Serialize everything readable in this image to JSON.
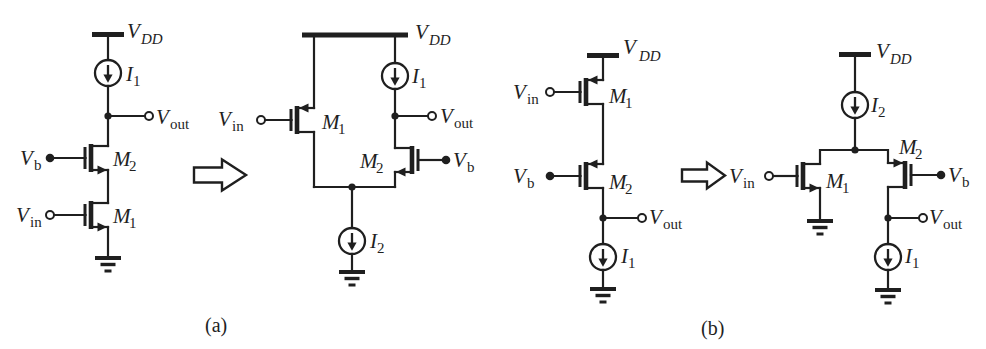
{
  "colors": {
    "ink": "#1f1f1f",
    "background": "#ffffff"
  },
  "labels": {
    "vdd": {
      "base": "V",
      "sub": "DD"
    },
    "vin": {
      "base": "V",
      "sub": "in"
    },
    "vout": {
      "base": "V",
      "sub": "out"
    },
    "vb": {
      "base": "V",
      "sub": "b"
    },
    "i1": {
      "base": "I",
      "sub": "1"
    },
    "i2": {
      "base": "I",
      "sub": "2"
    },
    "m1": {
      "base": "M",
      "sub": "1"
    },
    "m2": {
      "base": "M",
      "sub": "2"
    }
  },
  "captions": {
    "a": "(a)",
    "b": "(b)"
  }
}
